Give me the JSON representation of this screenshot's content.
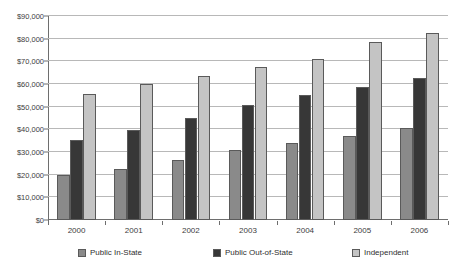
{
  "chart_data": {
    "type": "bar",
    "title": "",
    "subtitle": "",
    "xlabel": "",
    "ylabel": "",
    "categories": [
      "2000",
      "2001",
      "2002",
      "2003",
      "2004",
      "2005",
      "2006"
    ],
    "series": [
      {
        "name": "Public In-State",
        "color": "#8a8a8a",
        "values": [
          20000,
          22500,
          26500,
          30700,
          33800,
          37000,
          40600
        ]
      },
      {
        "name": "Public Out-of-State",
        "color": "#373737",
        "values": [
          35300,
          39700,
          45200,
          50800,
          55000,
          58500,
          62500
        ]
      },
      {
        "name": "Independent",
        "color": "#c4c4c4",
        "values": [
          55500,
          60000,
          63700,
          67400,
          71000,
          78500,
          82500
        ]
      }
    ],
    "ylim": [
      0,
      90000
    ],
    "ytick_values": [
      0,
      10000,
      20000,
      30000,
      40000,
      50000,
      60000,
      70000,
      80000,
      90000
    ],
    "ytick_labels": [
      "$0",
      "$10,000",
      "$20,000",
      "$30,000",
      "$40,000",
      "$50,000",
      "$60,000",
      "$70,000",
      "$80,000",
      "$90,000"
    ],
    "grid": true,
    "legend_position": "bottom"
  },
  "legend": {
    "items": [
      {
        "label": "Public In-State",
        "swatch": "s0"
      },
      {
        "label": "Public Out-of-State",
        "swatch": "s1"
      },
      {
        "label": "Independent",
        "swatch": "s2"
      }
    ]
  }
}
